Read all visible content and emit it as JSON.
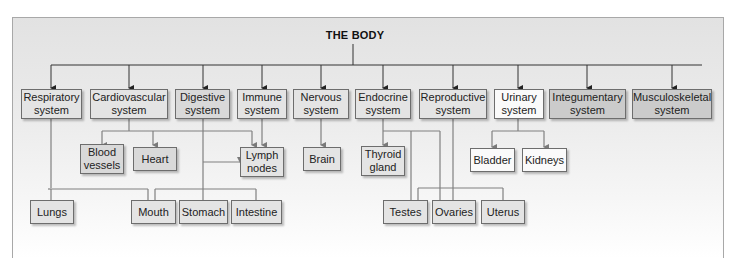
{
  "title": "THE BODY",
  "systems": [
    {
      "id": "respiratory",
      "label": "Respiratory system"
    },
    {
      "id": "cardiovascular",
      "label": "Cardiovascular system"
    },
    {
      "id": "digestive",
      "label": "Digestive system"
    },
    {
      "id": "immune",
      "label": "Immune system"
    },
    {
      "id": "nervous",
      "label": "Nervous system"
    },
    {
      "id": "endocrine",
      "label": "Endocrine system"
    },
    {
      "id": "reproductive",
      "label": "Reproductive system"
    },
    {
      "id": "urinary",
      "label": "Urinary system"
    },
    {
      "id": "integumentary",
      "label": "Integumentary system"
    },
    {
      "id": "musculoskeletal",
      "label": "Musculoskeletal system"
    }
  ],
  "organs_mid": [
    {
      "id": "blood-vessels",
      "label": "Blood vessels"
    },
    {
      "id": "heart",
      "label": "Heart"
    },
    {
      "id": "lymph-nodes",
      "label": "Lymph nodes"
    },
    {
      "id": "brain",
      "label": "Brain"
    },
    {
      "id": "thyroid-gland",
      "label": "Thyroid gland"
    },
    {
      "id": "bladder",
      "label": "Bladder"
    },
    {
      "id": "kidneys",
      "label": "Kidneys"
    }
  ],
  "organs_bottom": [
    {
      "id": "lungs",
      "label": "Lungs"
    },
    {
      "id": "mouth",
      "label": "Mouth"
    },
    {
      "id": "stomach",
      "label": "Stomach"
    },
    {
      "id": "intestine",
      "label": "Intestine"
    },
    {
      "id": "testes",
      "label": "Testes"
    },
    {
      "id": "ovaries",
      "label": "Ovaries"
    },
    {
      "id": "uterus",
      "label": "Uterus"
    }
  ],
  "edges": [
    [
      "THE BODY",
      "Respiratory system"
    ],
    [
      "THE BODY",
      "Cardiovascular system"
    ],
    [
      "THE BODY",
      "Digestive system"
    ],
    [
      "THE BODY",
      "Immune system"
    ],
    [
      "THE BODY",
      "Nervous system"
    ],
    [
      "THE BODY",
      "Endocrine system"
    ],
    [
      "THE BODY",
      "Reproductive system"
    ],
    [
      "THE BODY",
      "Urinary system"
    ],
    [
      "THE BODY",
      "Integumentary system"
    ],
    [
      "THE BODY",
      "Musculoskeletal system"
    ],
    [
      "Respiratory system",
      "Lungs"
    ],
    [
      "Respiratory system",
      "Mouth"
    ],
    [
      "Cardiovascular system",
      "Blood vessels"
    ],
    [
      "Cardiovascular system",
      "Heart"
    ],
    [
      "Cardiovascular system",
      "Lymph nodes"
    ],
    [
      "Digestive system",
      "Lymph nodes"
    ],
    [
      "Digestive system",
      "Stomach"
    ],
    [
      "Digestive system",
      "Mouth"
    ],
    [
      "Digestive system",
      "Intestine"
    ],
    [
      "Immune system",
      "Lymph nodes"
    ],
    [
      "Nervous system",
      "Brain"
    ],
    [
      "Endocrine system",
      "Thyroid gland"
    ],
    [
      "Endocrine system",
      "Testes"
    ],
    [
      "Endocrine system",
      "Ovaries"
    ],
    [
      "Reproductive system",
      "Ovaries"
    ],
    [
      "Reproductive system",
      "Testes"
    ],
    [
      "Reproductive system",
      "Uterus"
    ],
    [
      "Urinary system",
      "Bladder"
    ],
    [
      "Urinary system",
      "Kidneys"
    ]
  ]
}
